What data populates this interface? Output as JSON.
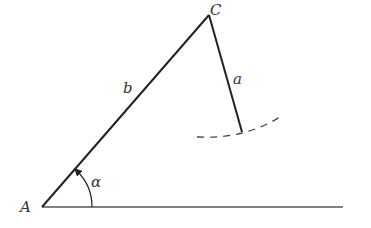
{
  "diagram": {
    "type": "geometry-triangle-construction",
    "colors": {
      "stroke": "#222222",
      "baseline": "#555555",
      "label": "#333333",
      "background": "#ffffff"
    },
    "points": {
      "A": {
        "label": "A",
        "x": 42,
        "y": 207
      },
      "C": {
        "label": "C",
        "x": 209,
        "y": 15
      },
      "a_end": {
        "x": 242,
        "y": 132
      },
      "baseline_end": {
        "x": 343,
        "y": 207
      }
    },
    "segments": {
      "b": {
        "label": "b",
        "from": "A",
        "to": "C"
      },
      "a": {
        "label": "a",
        "from": "C",
        "to": "a_end"
      },
      "baseline": {
        "from": "A",
        "to": "baseline_end"
      }
    },
    "angle": {
      "label": "α",
      "vertex": "A",
      "arrow": true
    },
    "arc": {
      "style": "dashed",
      "center": "C",
      "description": "locus of points at distance a from C"
    }
  }
}
